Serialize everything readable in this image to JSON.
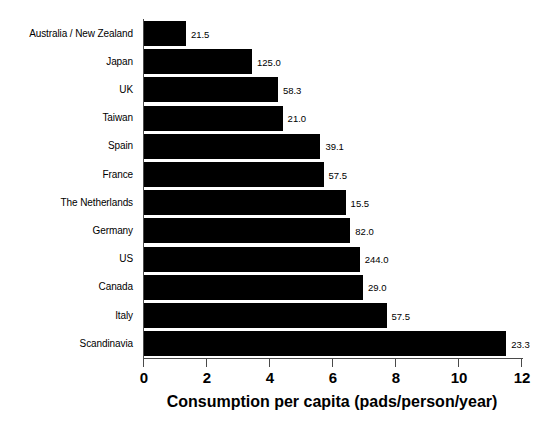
{
  "chart_data": {
    "type": "bar",
    "orientation": "horizontal",
    "title": "",
    "xlabel": "Consumption per capita (pads/person/year)",
    "ylabel": "",
    "xlim": [
      0,
      12
    ],
    "xticks": [
      0,
      2,
      4,
      6,
      8,
      10,
      12
    ],
    "xtick_labels": [
      "0",
      "2",
      "4",
      "6",
      "8",
      "10",
      "12"
    ],
    "grid": false,
    "legend": null,
    "bar_color": "#000000",
    "categories": [
      "Australia / New Zealand",
      "Japan",
      "UK",
      "Taiwan",
      "Spain",
      "France",
      "The Netherlands",
      "Germany",
      "US",
      "Canada",
      "Italy",
      "Scandinavia"
    ],
    "values": [
      1.33,
      3.43,
      4.25,
      4.4,
      5.6,
      5.7,
      6.4,
      6.55,
      6.85,
      6.95,
      7.7,
      11.5
    ],
    "annotations": [
      "21.5",
      "125.0",
      "58.3",
      "21.0",
      "39.1",
      "57.5",
      "15.5",
      "82.0",
      "244.0",
      "29.0",
      "57.5",
      "23.3"
    ]
  }
}
